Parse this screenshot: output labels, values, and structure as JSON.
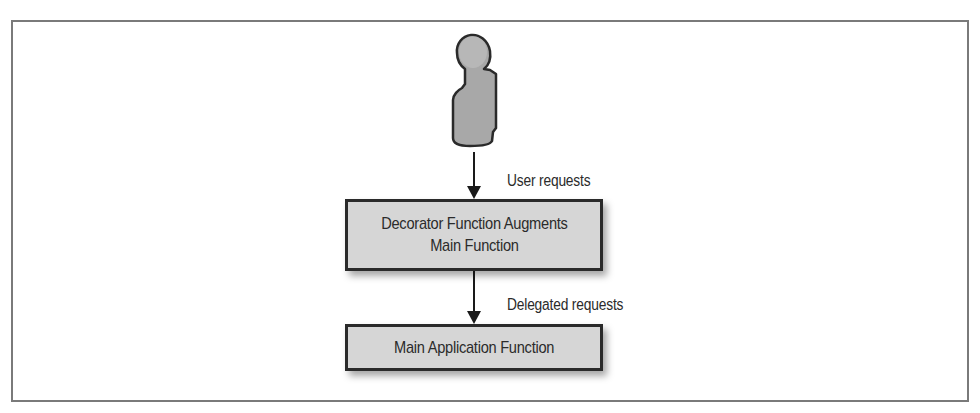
{
  "diagram": {
    "actor": {
      "icon": "person-icon",
      "fill": "#a8a8a8",
      "stroke": "#2a2a2a"
    },
    "edges": [
      {
        "from": "user",
        "to": "decorator",
        "label": "User requests"
      },
      {
        "from": "decorator",
        "to": "main",
        "label": "Delegated requests"
      }
    ],
    "nodes": {
      "decorator": {
        "line1": "Decorator Function Augments",
        "line2": "Main Function"
      },
      "main": {
        "label": "Main Application Function"
      }
    },
    "colors": {
      "box_fill": "#d6d6d6",
      "box_border": "#2a2a2a",
      "frame": "#7a7a7a",
      "text": "#2b2b2b"
    }
  }
}
